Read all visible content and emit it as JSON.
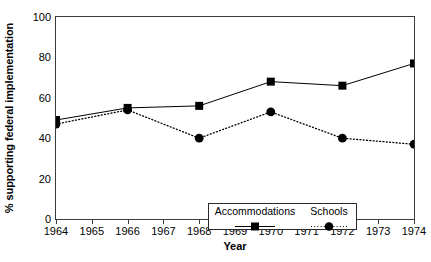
{
  "chart_data": {
    "type": "line",
    "title": "",
    "xlabel": "Year",
    "ylabel": "% supporting federal implementation",
    "x": [
      1964,
      1966,
      1968,
      1970,
      1972,
      1974
    ],
    "xlim": [
      1964,
      1974
    ],
    "ylim": [
      0,
      100
    ],
    "xtick_labels": [
      "1964",
      "1965",
      "1966",
      "1967",
      "1968",
      "1969",
      "1970",
      "1971",
      "1972",
      "1973",
      "1974"
    ],
    "xticks": [
      1964,
      1965,
      1966,
      1967,
      1968,
      1969,
      1970,
      1971,
      1972,
      1973,
      1974
    ],
    "ytick_labels": [
      "0",
      "20",
      "40",
      "60",
      "80",
      "100"
    ],
    "yticks": [
      0,
      20,
      40,
      60,
      80,
      100
    ],
    "yticks_minor": [
      10,
      30,
      50,
      70,
      90
    ],
    "grid": false,
    "legend_position": "lower center",
    "series": [
      {
        "name": "Accommodations",
        "marker": "square",
        "linestyle": "solid",
        "color": "#000000",
        "values": [
          49,
          55,
          56,
          68,
          66,
          77
        ]
      },
      {
        "name": "Schools",
        "marker": "circle",
        "linestyle": "dotted",
        "color": "#000000",
        "values": [
          47,
          54,
          40,
          53,
          40,
          37
        ]
      }
    ]
  },
  "legend": {
    "items": [
      {
        "label": "Accommodations"
      },
      {
        "label": "Schools"
      }
    ]
  }
}
